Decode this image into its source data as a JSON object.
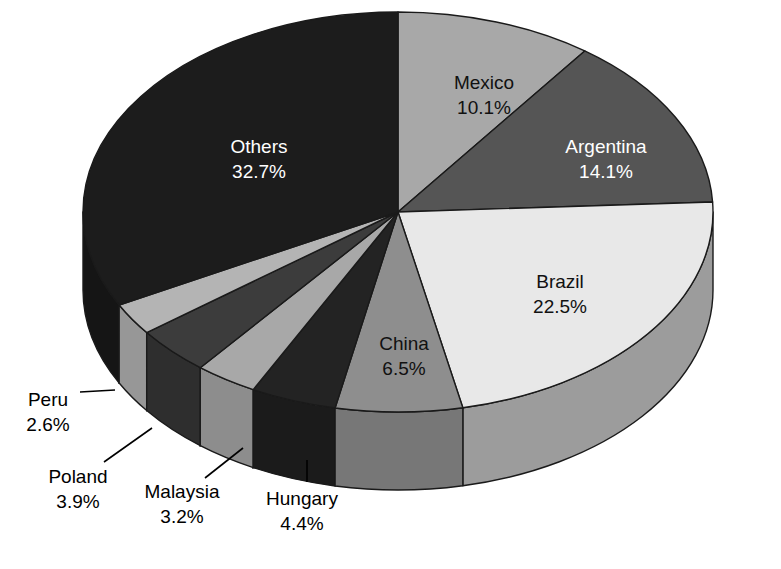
{
  "chart_data": {
    "type": "pie",
    "title": "",
    "subtitle": "",
    "xlabel": "",
    "ylabel": "",
    "legend_position": "none",
    "grid": false,
    "three_d": true,
    "start_angle_deg": 0,
    "direction": "clockwise",
    "categories": [
      "Mexico",
      "Argentina",
      "Brazil",
      "China",
      "Hungary",
      "Malaysia",
      "Poland",
      "Peru",
      "Others"
    ],
    "values": [
      10.1,
      14.1,
      22.5,
      6.5,
      4.4,
      3.2,
      3.9,
      2.6,
      32.7
    ],
    "unit": "%",
    "total": 100.0,
    "slices": [
      {
        "name": "Mexico",
        "value": 10.1,
        "value_label": "10.1%",
        "top_color": "#a8a8a8",
        "side_color": "#8d8d8d",
        "text_color": "#111111",
        "label_placement": "inside",
        "label_x": 484,
        "label_y": 84
      },
      {
        "name": "Argentina",
        "value": 14.1,
        "value_label": "14.1%",
        "top_color": "#555555",
        "side_color": "#434343",
        "text_color": "#ffffff",
        "label_placement": "inside",
        "label_y": 148,
        "label_x": 606
      },
      {
        "name": "Brazil",
        "value": 22.5,
        "value_label": "22.5%",
        "top_color": "#e8e8e8",
        "side_color": "#9c9c9c",
        "text_color": "#111111",
        "label_placement": "inside",
        "label_x": 560,
        "label_y": 283
      },
      {
        "name": "China",
        "value": 6.5,
        "value_label": "6.5%",
        "top_color": "#8e8e8e",
        "side_color": "#777777",
        "text_color": "#111111",
        "label_placement": "inside",
        "label_x": 404,
        "label_y": 345
      },
      {
        "name": "Hungary",
        "value": 4.4,
        "value_label": "4.4%",
        "top_color": "#232323",
        "side_color": "#1b1b1b",
        "text_color": "#000000",
        "label_placement": "outside",
        "label_x": 302,
        "label_y": 500,
        "leader": [
          [
            307,
            460
          ],
          [
            307,
            482
          ]
        ]
      },
      {
        "name": "Malaysia",
        "value": 3.2,
        "value_label": "3.2%",
        "top_color": "#a8a8a8",
        "side_color": "#8d8d8d",
        "text_color": "#000000",
        "label_placement": "outside",
        "label_x": 182,
        "label_y": 493,
        "leader": [
          [
            243,
            448
          ],
          [
            205,
            478
          ]
        ]
      },
      {
        "name": "Poland",
        "value": 3.9,
        "value_label": "3.9%",
        "top_color": "#3c3c3c",
        "side_color": "#2e2e2e",
        "text_color": "#000000",
        "label_placement": "outside",
        "label_x": 78,
        "label_y": 478,
        "leader": [
          [
            152,
            428
          ],
          [
            104,
            462
          ]
        ]
      },
      {
        "name": "Peru",
        "value": 2.6,
        "value_label": "2.6%",
        "top_color": "#b4b4b4",
        "side_color": "#979797",
        "text_color": "#000000",
        "label_placement": "outside",
        "label_x": 48,
        "label_y": 401,
        "leader": [
          [
            115,
            390
          ],
          [
            80,
            392
          ]
        ]
      },
      {
        "name": "Others",
        "value": 32.7,
        "value_label": "32.7%",
        "top_color": "#1c1c1c",
        "side_color": "#151515",
        "text_color": "#ffffff",
        "label_placement": "inside",
        "label_x": 259,
        "label_y": 148
      }
    ],
    "geometry": {
      "center_x": 398,
      "center_y": 212,
      "radius_x": 315,
      "radius_y": 200,
      "depth": 78
    },
    "background_color": "#ffffff",
    "outline_color": "#1a1a1a"
  }
}
